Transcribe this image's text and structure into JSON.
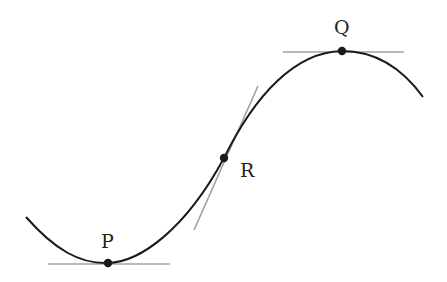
{
  "diagram": {
    "type": "curve-with-tangents",
    "colors": {
      "curve": "#1a1a1a",
      "tangent": "#a0a0a0",
      "point": "#1a1a1a",
      "label": "#222222",
      "background": "#ffffff"
    },
    "curve": {
      "start": [
        26,
        217
      ],
      "end": [
        423,
        97
      ]
    },
    "points": [
      {
        "id": "P",
        "label": "P",
        "x": 108,
        "y": 263,
        "label_x": 101,
        "label_y": 248,
        "role": "local minimum"
      },
      {
        "id": "R",
        "label": "R",
        "x": 224,
        "y": 158,
        "label_x": 240,
        "label_y": 177,
        "role": "inflection point"
      },
      {
        "id": "Q",
        "label": "Q",
        "x": 342,
        "y": 51,
        "label_x": 334,
        "label_y": 34,
        "role": "local maximum"
      }
    ],
    "tangents": [
      {
        "at": "P",
        "x1": 48,
        "y1": 264,
        "x2": 170,
        "y2": 264
      },
      {
        "at": "R",
        "x1": 194,
        "y1": 230,
        "x2": 258,
        "y2": 86
      },
      {
        "at": "Q",
        "x1": 283,
        "y1": 52,
        "x2": 404,
        "y2": 52
      }
    ]
  }
}
